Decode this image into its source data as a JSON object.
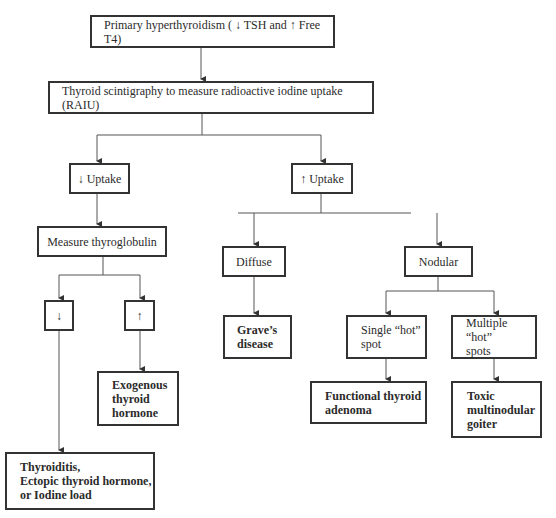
{
  "flowchart": {
    "nodes": {
      "primary": {
        "label": "Primary hyperthyroidism ( ↓ TSH and ↑ Free T4)"
      },
      "scintigraphy": {
        "label": "Thyroid scintigraphy to measure radioactive iodine uptake (RAIU)"
      },
      "low_uptake": {
        "label": "↓ Uptake"
      },
      "high_uptake": {
        "label": "↑ Uptake"
      },
      "thyroglobulin": {
        "label": "Measure thyroglobulin"
      },
      "tg_low": {
        "label": "↓"
      },
      "tg_high": {
        "label": "↑"
      },
      "diffuse": {
        "label": "Diffuse"
      },
      "nodular": {
        "label": "Nodular"
      },
      "graves": {
        "label": "Grave’s\ndisease"
      },
      "single_hot": {
        "label": "Single “hot”\nspot"
      },
      "multiple_hot": {
        "label": "Multiple “hot”\nspots"
      },
      "exogenous": {
        "label": "Exogenous\nthyroid\nhormone"
      },
      "adenoma": {
        "label": "Functional thyroid\nadenoma"
      },
      "toxic_goiter": {
        "label": "Toxic\nmultinodular\ngoiter"
      },
      "thyroiditis": {
        "label": "Thyroiditis,\nEctopic thyroid hormone,\nor Iodine load"
      }
    },
    "colors": {
      "line": "#555555",
      "border": "#333333",
      "text": "#2b2b2b"
    }
  }
}
